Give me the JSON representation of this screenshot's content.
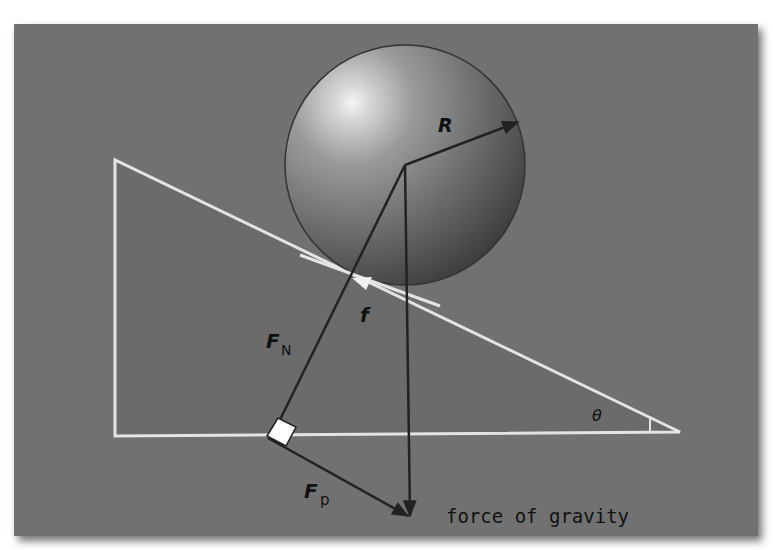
{
  "diagram": {
    "title": "",
    "labels": {
      "radius": "R",
      "friction": "f",
      "normal_force_main": "F",
      "normal_force_sub": "N",
      "parallel_force_main": "F",
      "parallel_force_sub": "p",
      "angle": "θ",
      "gravity": "force of gravity"
    },
    "colors": {
      "page_background": "#ffffff",
      "panel_background": "#717171",
      "incline_fill": "#6a6a6a",
      "incline_outline": "#e6e6e6",
      "vector_lines": "#222222",
      "sphere_highlight": "#f4f4f4",
      "sphere_shadow": "#3a3a3a",
      "right_angle_marker": "#ffffff"
    },
    "elements": {
      "sphere": {
        "cx": 405,
        "cy": 165,
        "r": 120
      },
      "incline": {
        "top": [
          115,
          160
        ],
        "bottom_left": [
          115,
          436
        ],
        "bottom_right": [
          680,
          432
        ]
      },
      "vectors": [
        {
          "name": "radius",
          "from": [
            405,
            165
          ],
          "to": [
            518,
            122
          ]
        },
        {
          "name": "normal-force",
          "from": [
            405,
            165
          ],
          "to": [
            272,
            436
          ]
        },
        {
          "name": "gravity",
          "from": [
            405,
            165
          ],
          "to": [
            410,
            518
          ]
        },
        {
          "name": "parallel-force",
          "from": [
            268,
            438
          ],
          "to": [
            410,
            518
          ]
        },
        {
          "name": "friction",
          "at": [
            362,
            283
          ]
        }
      ]
    }
  }
}
